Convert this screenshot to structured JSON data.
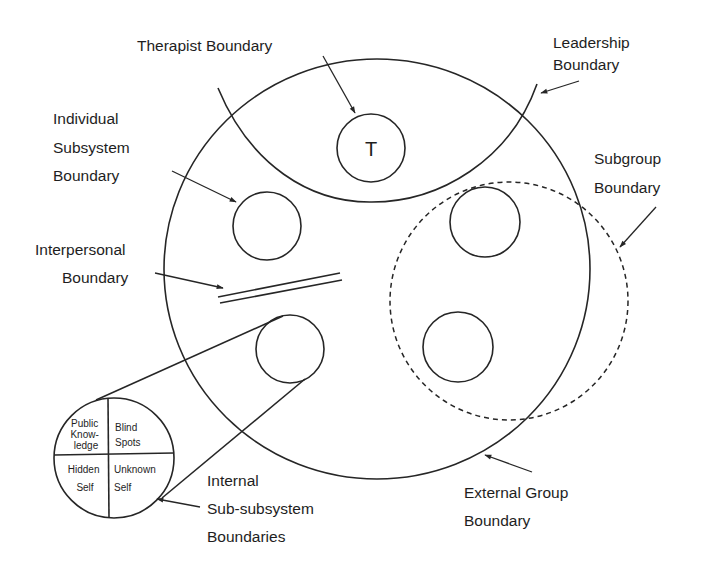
{
  "diagram": {
    "type": "group boundaries diagram",
    "colors": {
      "ink": "#262626",
      "background": "#ffffff"
    },
    "therapist": {
      "symbol": "T"
    },
    "labels": {
      "therapist_boundary": "Therapist Boundary",
      "leadership_boundary": [
        "Leadership",
        "Boundary"
      ],
      "individual_subsystem_boundary": [
        "Individual",
        "Subsystem",
        "Boundary"
      ],
      "subgroup_boundary": [
        "Subgroup",
        "Boundary"
      ],
      "interpersonal_boundary": [
        "Interpersonal",
        "Boundary"
      ],
      "internal_sub_subsystem_boundaries": [
        "Internal",
        "Sub-subsystem",
        "Boundaries"
      ],
      "external_group_boundary": [
        "External Group",
        "Boundary"
      ]
    },
    "johari_window": {
      "quadrants": [
        {
          "position": "top-left",
          "lines": [
            "Public",
            "Know-",
            "ledge"
          ]
        },
        {
          "position": "top-right",
          "lines": [
            "Blind",
            "Spots"
          ]
        },
        {
          "position": "bottom-left",
          "lines": [
            "Hidden",
            "Self"
          ]
        },
        {
          "position": "bottom-right",
          "lines": [
            "Unknown",
            "Self"
          ]
        }
      ]
    }
  }
}
